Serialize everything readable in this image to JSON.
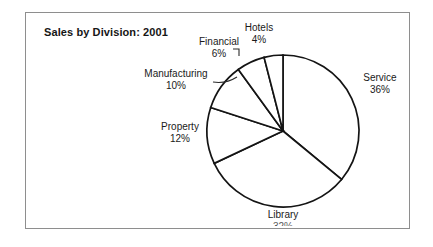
{
  "figure": {
    "title": "Sales by Division: 2001",
    "background_color": "#ffffff",
    "frame_color": "#8e8e8e",
    "outline_color": "#141414"
  },
  "chart_data": {
    "type": "pie",
    "title": "Sales by Division: 2001",
    "xlabel": "",
    "ylabel": "",
    "unit": "%",
    "start_angle_deg": 0,
    "direction": "clockwise",
    "legend": "none",
    "grid": false,
    "labels_position": "outside",
    "categories": [
      "Service",
      "Library",
      "Property",
      "Manufacturing",
      "Financial",
      "Hotels"
    ],
    "values": [
      36,
      32,
      12,
      10,
      6,
      4
    ],
    "slices": [
      {
        "name": "Service",
        "value": 36,
        "percent_label": "36%",
        "fill": "#ffffff"
      },
      {
        "name": "Library",
        "value": 32,
        "percent_label": "32%",
        "fill": "#ffffff"
      },
      {
        "name": "Property",
        "value": 12,
        "percent_label": "12%",
        "fill": "#ffffff"
      },
      {
        "name": "Manufacturing",
        "value": 10,
        "percent_label": "10%",
        "fill": "#ffffff"
      },
      {
        "name": "Financial",
        "value": 6,
        "percent_label": "6%",
        "fill": "#ffffff"
      },
      {
        "name": "Hotels",
        "value": 4,
        "percent_label": "4%",
        "fill": "#ffffff"
      }
    ]
  },
  "labels": {
    "service": {
      "name": "Service",
      "pct": "36%"
    },
    "library": {
      "name": "Library",
      "pct": "32%"
    },
    "property": {
      "name": "Property",
      "pct": "12%"
    },
    "manufacturing": {
      "name": "Manufacturing",
      "pct": "10%"
    },
    "financial": {
      "name": "Financial",
      "pct": "6%"
    },
    "hotels": {
      "name": "Hotels",
      "pct": "4%"
    }
  }
}
